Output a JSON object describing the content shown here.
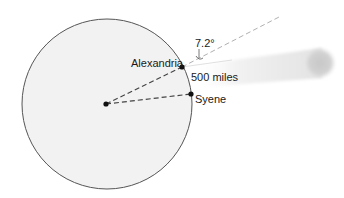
{
  "diagram": {
    "type": "eratosthenes-earth-circumference",
    "labels": {
      "alexandria": "Alexandria",
      "syene": "Syene",
      "distance": "500 miles",
      "angle": "7.2°"
    },
    "colors": {
      "earth_fill": "#f2f2f2",
      "earth_stroke": "#555555",
      "dash_line": "#444444",
      "extension_line": "#b0b0b0",
      "sun_beam": "#e8e8e8",
      "sun": "#cfcfcf",
      "points": "#111111",
      "text": "#1a1a1a"
    },
    "elements": {
      "earth": {
        "cx": 107,
        "cy": 104,
        "r": 85
      },
      "center_point": {
        "x": 106,
        "y": 104
      },
      "alexandria_point": {
        "x": 182,
        "y": 67
      },
      "syene_point": {
        "x": 191,
        "y": 94
      },
      "extension_end": {
        "x": 281,
        "y": 16
      },
      "sun": {
        "cx": 320,
        "cy": 63,
        "r": 15
      }
    }
  }
}
